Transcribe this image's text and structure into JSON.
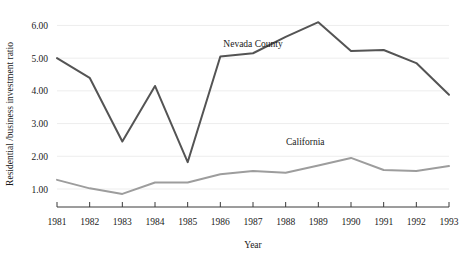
{
  "chart_data": {
    "type": "line",
    "title": "",
    "xlabel": "Year",
    "ylabel": "Residential /business investment ratio",
    "x": [
      1981,
      1982,
      1983,
      1984,
      1985,
      1986,
      1987,
      1988,
      1989,
      1990,
      1991,
      1992,
      1993
    ],
    "categories": [
      "1981",
      "1982",
      "1983",
      "1984",
      "1985",
      "1986",
      "1987",
      "1988",
      "1989",
      "1990",
      "1991",
      "1992",
      "1993"
    ],
    "xlim": [
      1981,
      1993
    ],
    "ylim": [
      0.45,
      6.35
    ],
    "yticks": [
      1.0,
      2.0,
      3.0,
      4.0,
      5.0,
      6.0
    ],
    "ytick_labels": [
      "1.00",
      "2.00",
      "3.00",
      "4.00",
      "5.00",
      "6.00"
    ],
    "grid": "horizontal",
    "legend_position": "inline-annotation",
    "series": [
      {
        "name": "Nevada County",
        "color": "#545454",
        "label_x": 1987.0,
        "label_y": 5.35,
        "values": [
          5.0,
          4.4,
          2.45,
          4.15,
          1.82,
          5.05,
          5.15,
          5.65,
          6.1,
          5.22,
          5.25,
          4.85,
          3.88
        ]
      },
      {
        "name": "California",
        "color": "#9d9d9d",
        "label_x": 1988.6,
        "label_y": 2.35,
        "values": [
          1.28,
          1.02,
          0.85,
          1.2,
          1.2,
          1.45,
          1.55,
          1.5,
          1.72,
          1.95,
          1.58,
          1.55,
          1.7
        ]
      }
    ]
  },
  "axis": {
    "y_title": "Residential /business investment ratio",
    "x_title": "Year"
  }
}
